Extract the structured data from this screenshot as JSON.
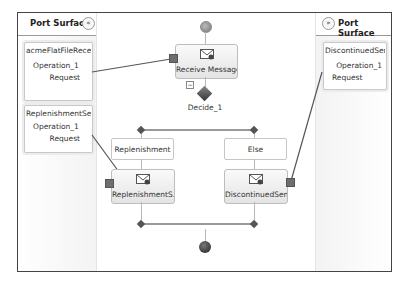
{
  "left_port_surface": {
    "title": "Port Surface",
    "collapse_glyph": "«",
    "ports": [
      {
        "name": "acmeFlatFileRecei...",
        "operation": "Operation_1",
        "message": "Request"
      },
      {
        "name": "ReplenishmentSe...",
        "operation": "Operation_1",
        "message": "Request"
      }
    ]
  },
  "right_port_surface": {
    "title": "Port Surface",
    "collapse_glyph": "»",
    "ports": [
      {
        "name": "DiscontinuedSend...",
        "operation": "Operation_1",
        "message": "Request"
      }
    ]
  },
  "orchestration": {
    "receive_shape": {
      "label": "Receive Message",
      "icon": "envelope-receive-icon"
    },
    "decide_shape": {
      "label": "Decide_1",
      "collapse_glyph": "−"
    },
    "branches": [
      {
        "label": "Replenishment",
        "send_shape": {
          "label": "ReplenishmentS...",
          "icon": "envelope-send-icon"
        }
      },
      {
        "label": "Else",
        "send_shape": {
          "label": "DiscontinuedSend",
          "icon": "envelope-send-icon"
        }
      }
    ]
  },
  "colors": {
    "frame_border": "#444444",
    "connector": "#6e6e6e",
    "decision_diamond": "#444444",
    "link_line": "#555555"
  }
}
